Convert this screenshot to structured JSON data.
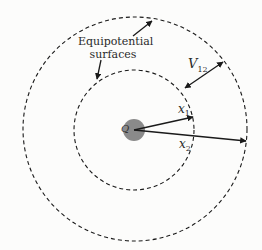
{
  "diagram": {
    "labels": {
      "surfaces_line1": "Equipotential",
      "surfaces_line2": "surfaces",
      "charge": "Q",
      "potential_diff": "V",
      "potential_diff_sub": "12",
      "radius1": "x",
      "radius1_sub": "1",
      "radius2": "x",
      "radius2_sub": "2"
    },
    "colors": {
      "line": "#1a1a1a",
      "charge_fill": "#8a8a8a",
      "background": "#fcfcfb"
    },
    "geometry": {
      "center": [
        134,
        130
      ],
      "charge_radius": 11,
      "inner_circle_radius": 60,
      "outer_circle_radius": 112
    }
  }
}
